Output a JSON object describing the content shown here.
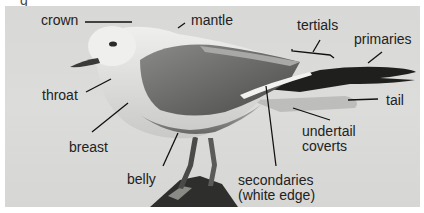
{
  "figure": {
    "caption_fragment": "g",
    "background_color": "#d9d9d7",
    "labels": {
      "crown": "crown",
      "mantle": "mantle",
      "tertials": "tertials",
      "primaries": "primaries",
      "throat": "throat",
      "tail": "tail",
      "breast": "breast",
      "undertail_coverts_line1": "undertail",
      "undertail_coverts_line2": "coverts",
      "belly": "belly",
      "secondaries_line1": "secondaries",
      "secondaries_line2": "(white edge)"
    }
  }
}
